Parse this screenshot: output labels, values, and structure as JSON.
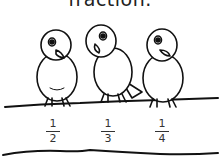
{
  "worksheet": {
    "title": "fraction.",
    "fractions": [
      {
        "numerator": "1",
        "denominator": "2"
      },
      {
        "numerator": "1",
        "denominator": "3"
      },
      {
        "numerator": "1",
        "denominator": "4"
      }
    ],
    "illustration": "three-birds-on-branch"
  }
}
